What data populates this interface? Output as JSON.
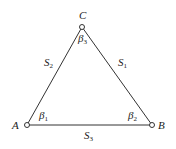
{
  "diagram": {
    "type": "triangle",
    "vertices": [
      {
        "name": "A",
        "label": "A"
      },
      {
        "name": "B",
        "label": "B"
      },
      {
        "name": "C",
        "label": "C"
      }
    ],
    "sides": [
      {
        "name": "S1",
        "base": "S",
        "sub": "1",
        "between": "B-C"
      },
      {
        "name": "S2",
        "base": "S",
        "sub": "2",
        "between": "A-C"
      },
      {
        "name": "S3",
        "base": "S",
        "sub": "3",
        "between": "A-B"
      }
    ],
    "angles": [
      {
        "name": "beta1",
        "base": "β",
        "sub": "1",
        "at": "A"
      },
      {
        "name": "beta2",
        "base": "β",
        "sub": "2",
        "at": "B"
      },
      {
        "name": "beta3",
        "base": "β",
        "sub": "3",
        "at": "C"
      }
    ],
    "colors": {
      "stroke": "#333333",
      "background": "#ffffff"
    }
  }
}
